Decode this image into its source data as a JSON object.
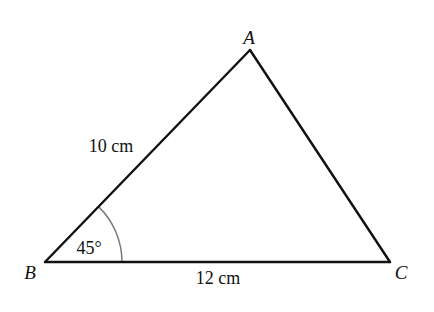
{
  "diagram": {
    "type": "triangle",
    "vertices": {
      "A": {
        "label": "A",
        "x": 250,
        "y": 50,
        "label_x": 249,
        "label_y": 44
      },
      "B": {
        "label": "B",
        "x": 45,
        "y": 262,
        "label_x": 30,
        "label_y": 279
      },
      "C": {
        "label": "C",
        "x": 390,
        "y": 262,
        "label_x": 401,
        "label_y": 279
      }
    },
    "sides": {
      "AB": {
        "label": "10 cm",
        "label_x": 111,
        "label_y": 152
      },
      "BC": {
        "label": "12 cm",
        "label_x": 218,
        "label_y": 284
      },
      "CA": {
        "label": ""
      }
    },
    "angles": {
      "B": {
        "label": "45°",
        "value_deg": 45,
        "label_x": 89,
        "label_y": 254,
        "arc_radius": 77
      }
    },
    "colors": {
      "line": "#111111",
      "arc": "#7a7a7a",
      "background": "#ffffff"
    }
  }
}
